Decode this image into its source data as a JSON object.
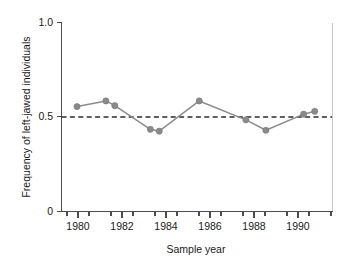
{
  "chart_data": {
    "type": "line",
    "title": "",
    "xlabel": "Sample year",
    "ylabel": "Frequency of left-jawed individuals",
    "xlim": [
      1979.0,
      1991.2
    ],
    "ylim": [
      0,
      1.0
    ],
    "grid": false,
    "legend": null,
    "x_ticks_major": [
      1980,
      1982,
      1984,
      1986,
      1988,
      1990
    ],
    "x_tick_labels": [
      "1980",
      "1982",
      "1984",
      "1986",
      "1988",
      "1990"
    ],
    "x_ticks_minor": [
      1979.5,
      1980.5,
      1981.5,
      1982.5,
      1983.5,
      1984.5,
      1985.5,
      1986.5,
      1987.5,
      1988.5,
      1989.5,
      1990.5
    ],
    "y_ticks": [
      0,
      0.5,
      1.0
    ],
    "y_tick_labels": [
      "0",
      "0.5",
      "1.0"
    ],
    "series": [
      {
        "name": "Frequency of left-jawed individuals",
        "marker": "circle",
        "color": "#8a8a8a",
        "x": [
          1979.7,
          1981.0,
          1981.4,
          1983.0,
          1983.4,
          1985.2,
          1987.3,
          1988.2,
          1989.9,
          1990.4
        ],
        "values": [
          0.555,
          0.585,
          0.56,
          0.435,
          0.425,
          0.585,
          0.485,
          0.43,
          0.515,
          0.53
        ]
      }
    ],
    "annotations": [
      {
        "type": "hline",
        "name": "reference-line-half",
        "y": 0.5,
        "style": "dashed",
        "color": "#2b2b2b"
      }
    ]
  }
}
